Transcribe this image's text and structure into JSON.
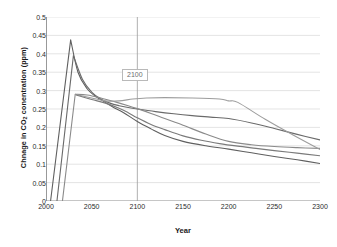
{
  "chart_data": {
    "type": "line",
    "title": "",
    "xlabel": "Year",
    "ylabel": "Chnage in CO2 conentration (ppm)",
    "ylabel_prefix": "Chnage in CO",
    "ylabel_sub": "2",
    "ylabel_suffix": " conentration (ppm)",
    "xlim": [
      2000,
      2300
    ],
    "ylim": [
      0,
      0.5
    ],
    "xticks": [
      2000,
      2050,
      2100,
      2150,
      2200,
      2250,
      2300
    ],
    "xtick_labels": [
      "2000",
      "2050",
      "2100",
      "2150",
      "2200",
      "2250",
      "2300"
    ],
    "yticks": [
      0,
      0.05,
      0.1,
      0.15,
      0.2,
      0.25,
      0.3,
      0.35,
      0.4,
      0.45,
      0.5
    ],
    "ytick_labels": [
      "0",
      "0.05",
      "0.1",
      "0.15",
      "0.2",
      "0.25",
      "0.3",
      "0.35",
      "0.4",
      "0.45",
      "0.5"
    ],
    "grid": "horizontal",
    "legend": "none",
    "annotations": [
      {
        "text": "2100",
        "x": 2100,
        "y": 0.365,
        "kind": "vertical-marker-label"
      }
    ],
    "markers": [
      {
        "type": "vline",
        "x": 2100,
        "color": "#9a9a9a"
      }
    ],
    "series": [
      {
        "name": "series-1",
        "color": "#5f5f5f",
        "width": 1.1,
        "points": [
          [
            2005,
            0.0
          ],
          [
            2027,
            0.438
          ],
          [
            2035,
            0.35
          ],
          [
            2045,
            0.305
          ],
          [
            2055,
            0.283
          ],
          [
            2065,
            0.268
          ],
          [
            2075,
            0.253
          ],
          [
            2085,
            0.24
          ],
          [
            2100,
            0.216
          ],
          [
            2115,
            0.196
          ],
          [
            2130,
            0.178
          ],
          [
            2150,
            0.162
          ],
          [
            2175,
            0.15
          ],
          [
            2200,
            0.141
          ],
          [
            2225,
            0.131
          ],
          [
            2250,
            0.121
          ],
          [
            2275,
            0.112
          ],
          [
            2300,
            0.102
          ]
        ]
      },
      {
        "name": "series-2",
        "color": "#6a6a6a",
        "width": 1.1,
        "points": [
          [
            2012,
            0.0
          ],
          [
            2030,
            0.395
          ],
          [
            2040,
            0.33
          ],
          [
            2050,
            0.296
          ],
          [
            2060,
            0.277
          ],
          [
            2070,
            0.266
          ],
          [
            2080,
            0.259
          ],
          [
            2090,
            0.254
          ],
          [
            2100,
            0.25
          ],
          [
            2120,
            0.243
          ],
          [
            2140,
            0.237
          ],
          [
            2160,
            0.232
          ],
          [
            2180,
            0.228
          ],
          [
            2200,
            0.224
          ],
          [
            2225,
            0.212
          ],
          [
            2250,
            0.197
          ],
          [
            2275,
            0.181
          ],
          [
            2300,
            0.166
          ]
        ]
      },
      {
        "name": "series-3",
        "color": "#8a8a8a",
        "width": 1.1,
        "points": [
          [
            2018,
            0.0
          ],
          [
            2032,
            0.29
          ],
          [
            2045,
            0.288
          ],
          [
            2060,
            0.28
          ],
          [
            2075,
            0.27
          ],
          [
            2090,
            0.259
          ],
          [
            2100,
            0.251
          ],
          [
            2115,
            0.238
          ],
          [
            2130,
            0.224
          ],
          [
            2150,
            0.206
          ],
          [
            2175,
            0.182
          ],
          [
            2200,
            0.162
          ],
          [
            2225,
            0.153
          ],
          [
            2250,
            0.148
          ],
          [
            2275,
            0.145
          ],
          [
            2300,
            0.143
          ]
        ]
      },
      {
        "name": "series-4",
        "color": "#9d9d9d",
        "width": 1.1,
        "points": [
          [
            2032,
            0.29
          ],
          [
            2050,
            0.28
          ],
          [
            2065,
            0.272
          ],
          [
            2080,
            0.272
          ],
          [
            2095,
            0.277
          ],
          [
            2110,
            0.28
          ],
          [
            2130,
            0.281
          ],
          [
            2160,
            0.28
          ],
          [
            2190,
            0.277
          ],
          [
            2200,
            0.272
          ],
          [
            2210,
            0.268
          ],
          [
            2240,
            0.222
          ],
          [
            2270,
            0.18
          ],
          [
            2300,
            0.14
          ]
        ]
      },
      {
        "name": "series-5",
        "color": "#7a7a7a",
        "width": 1.1,
        "points": [
          [
            2033,
            0.288
          ],
          [
            2050,
            0.276
          ],
          [
            2065,
            0.266
          ],
          [
            2080,
            0.252
          ],
          [
            2090,
            0.24
          ],
          [
            2100,
            0.226
          ],
          [
            2115,
            0.208
          ],
          [
            2130,
            0.194
          ],
          [
            2150,
            0.177
          ],
          [
            2170,
            0.165
          ],
          [
            2190,
            0.156
          ],
          [
            2210,
            0.149
          ],
          [
            2230,
            0.143
          ],
          [
            2250,
            0.137
          ],
          [
            2275,
            0.13
          ],
          [
            2300,
            0.123
          ]
        ]
      }
    ]
  }
}
